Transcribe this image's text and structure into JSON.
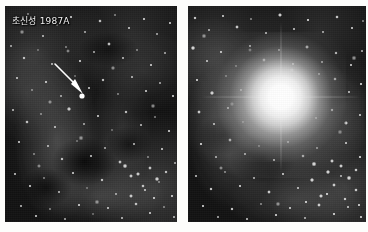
{
  "figure": {
    "kind": "astronomy-photo-pair",
    "background_color": "#fdfdfb"
  },
  "panels": [
    {
      "id": "before",
      "name": "panel-before",
      "label": "초신성 1987A",
      "has_label": true,
      "has_arrow": true,
      "arrow_label": "arrow pointing to progenitor star",
      "description": "Dense star field with faint nebulosity and dark dust lanes; an arrow marks the progenitor star before the explosion.",
      "background_color": "#121212",
      "star_color": "#ffffff"
    },
    {
      "id": "after",
      "name": "panel-after",
      "label": "",
      "has_label": false,
      "has_arrow": false,
      "description": "Same field after the supernova; a brilliant white blaze dominates the centre with diffraction spikes.",
      "background_color": "#121212",
      "star_color": "#ffffff",
      "supernova_color": "#ffffff"
    }
  ],
  "colors": {
    "page": "#fdfdfb",
    "sky": "#121212",
    "star": "#ffffff",
    "label_text": "#f2f2f2",
    "arrow": "#ffffff"
  }
}
